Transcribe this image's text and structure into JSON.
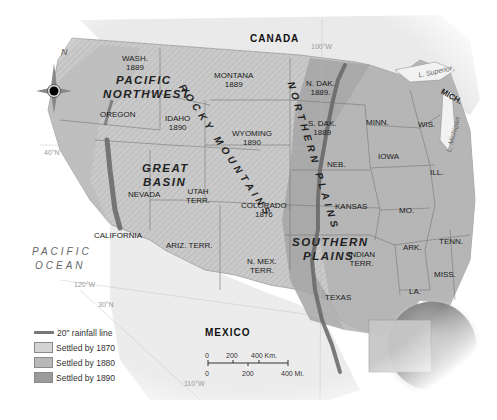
{
  "map": {
    "title": "Western United States Settlement and 20-inch Rainfall Line",
    "country_labels": {
      "canada": "CANADA",
      "mexico": "MEXICO"
    },
    "ocean_labels": {
      "pacific_line1": "PACIFIC",
      "pacific_line2": "OCEAN"
    },
    "region_labels": {
      "pacific_nw_line1": "PACIFIC",
      "pacific_nw_line2": "NORTHWEST",
      "great_basin_line1": "GREAT",
      "great_basin_line2": "BASIN",
      "rocky_mountains": "ROCKY MOUNTAINS",
      "northern_plains": "NORTHERN PLAINS",
      "southern_plains_line1": "SOUTHERN",
      "southern_plains_line2": "PLAINS"
    },
    "states": [
      {
        "name": "WASH.",
        "year": "1889"
      },
      {
        "name": "OREGON",
        "year": ""
      },
      {
        "name": "IDAHO",
        "year": "1890"
      },
      {
        "name": "MONTANA",
        "year": "1889"
      },
      {
        "name": "WYOMING",
        "year": "1890"
      },
      {
        "name": "N. DAK.",
        "year": "1889."
      },
      {
        "name": "S. DAK.",
        "year": "1889"
      },
      {
        "name": "NEVADA",
        "year": ""
      },
      {
        "name": "UTAH",
        "year": "TERR."
      },
      {
        "name": "COLORADO",
        "year": "1876"
      },
      {
        "name": "CALIFORNIA",
        "year": ""
      },
      {
        "name": "ARIZ. TERR.",
        "year": ""
      },
      {
        "name": "N. MEX.",
        "year": "TERR."
      },
      {
        "name": "NEB.",
        "year": ""
      },
      {
        "name": "KANSAS",
        "year": ""
      },
      {
        "name": "INDIAN",
        "year": "TERR."
      },
      {
        "name": "TEXAS",
        "year": ""
      },
      {
        "name": "MINN.",
        "year": ""
      },
      {
        "name": "IOWA",
        "year": ""
      },
      {
        "name": "WIS.",
        "year": ""
      },
      {
        "name": "MICH.",
        "year": ""
      },
      {
        "name": "ILL.",
        "year": ""
      },
      {
        "name": "MO.",
        "year": ""
      },
      {
        "name": "ARK.",
        "year": ""
      },
      {
        "name": "TENN.",
        "year": ""
      },
      {
        "name": "MISS.",
        "year": ""
      },
      {
        "name": "LA.",
        "year": ""
      }
    ],
    "lakes": {
      "superior": "L. Superior",
      "michigan": "L. Michigan"
    },
    "grid_labels": {
      "lon_100": "100°W",
      "lat_40": "40°N",
      "lon_120": "120°W",
      "lat_30": "30°N",
      "lon_110": "110°W"
    },
    "compass": {
      "north_label": "N"
    }
  },
  "legend": {
    "items": [
      {
        "label": "20\" rainfall line",
        "type": "line",
        "color": "#777777"
      },
      {
        "label": "Settled by 1870",
        "type": "swatch",
        "color": "#d3d3d3"
      },
      {
        "label": "Settled by 1880",
        "type": "swatch",
        "color": "#b8b8b8"
      },
      {
        "label": "Settled by 1890",
        "type": "swatch",
        "color": "#9a9a9a"
      }
    ]
  },
  "scale_bar": {
    "km_labels": [
      "0",
      "200",
      "400 Km."
    ],
    "mi_labels": [
      "0",
      "200",
      "400 Mi."
    ]
  }
}
